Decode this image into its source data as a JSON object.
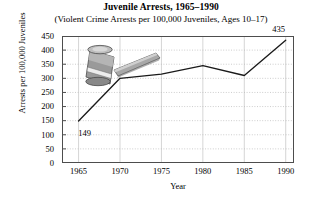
{
  "chart_data": {
    "type": "line",
    "title": "Juvenile Arrests, 1965–1990",
    "subtitle": "(Violent Crime Arrests per 100,000 Juveniles, Ages 10–17)",
    "xlabel": "Year",
    "ylabel": "Arrests per 100,000 Juveniles",
    "x": [
      1965,
      1970,
      1975,
      1980,
      1985,
      1990
    ],
    "values": [
      149,
      300,
      315,
      345,
      310,
      435
    ],
    "categories": [
      "1965",
      "1970",
      "1975",
      "1980",
      "1985",
      "1990"
    ],
    "xlim": [
      1963,
      1991
    ],
    "ylim": [
      0,
      450
    ],
    "xticks": [
      "1965",
      "1970",
      "1975",
      "1980",
      "1985",
      "1990"
    ],
    "yticks": [
      "0",
      "50",
      "100",
      "150",
      "200",
      "250",
      "300",
      "350",
      "400",
      "450"
    ],
    "ytick_values": [
      0,
      50,
      100,
      150,
      200,
      250,
      300,
      350,
      400,
      450
    ],
    "grid": true,
    "legend": false,
    "line_color": "#1a1a1a",
    "grid_color": "#b8b8b8",
    "axis_color": "#4d4d4d",
    "annotations": [
      {
        "name": "first-point-label",
        "text": "149",
        "x": 1965,
        "y": 149,
        "dx": 6,
        "dy": 12
      },
      {
        "name": "last-point-label",
        "text": "435",
        "x": 1990,
        "y": 435,
        "dx": -7,
        "dy": -11
      }
    ],
    "decoration": {
      "name": "gavel-illustration",
      "description": "gavel",
      "head_color": "#8f8f8f",
      "handle_color": "#a5a5a5",
      "band_color": "#e8e8e8",
      "outline_color": "#4a4a4a"
    }
  }
}
